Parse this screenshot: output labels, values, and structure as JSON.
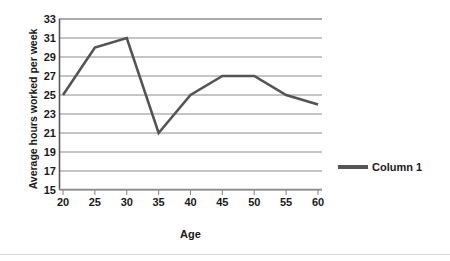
{
  "chart_data": {
    "type": "line",
    "title": "",
    "xlabel": "Age",
    "ylabel": "Average hours worked per week",
    "x": [
      20,
      25,
      30,
      35,
      40,
      45,
      50,
      55,
      60
    ],
    "categories": [
      "20",
      "25",
      "30",
      "35",
      "40",
      "45",
      "50",
      "55",
      "60"
    ],
    "series": [
      {
        "name": "Column 1",
        "values": [
          25,
          30,
          31,
          21,
          25,
          27,
          27,
          25,
          24
        ],
        "color": "#545454"
      }
    ],
    "xlim": [
      20,
      60
    ],
    "ylim": [
      15,
      33
    ],
    "yticks": [
      15,
      17,
      19,
      21,
      23,
      25,
      27,
      29,
      31,
      33
    ],
    "ytick_labels": [
      "15",
      "17",
      "19",
      "21",
      "23",
      "25",
      "27",
      "29",
      "31",
      "33"
    ],
    "xticks": [
      20,
      25,
      30,
      35,
      40,
      45,
      50,
      55,
      60
    ],
    "xtick_labels": [
      "20",
      "25",
      "30",
      "35",
      "40",
      "45",
      "50",
      "55",
      "60"
    ],
    "grid": "horizontal",
    "legend_position": "right",
    "legend_entries": [
      "Column 1"
    ],
    "gridline_color": "#8c8c8c",
    "axis_color": "#595959",
    "background_color": "#ffffff"
  }
}
